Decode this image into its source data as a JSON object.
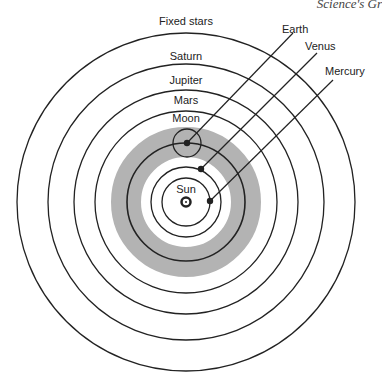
{
  "header": {
    "running_title": "Science's Gr"
  },
  "diagram": {
    "center_label": "Sun",
    "orbits": [
      {
        "name": "Fixed stars",
        "label": "Fixed stars"
      },
      {
        "name": "Saturn",
        "label": "Saturn"
      },
      {
        "name": "Jupiter",
        "label": "Jupiter"
      },
      {
        "name": "Mars",
        "label": "Mars"
      },
      {
        "name": "Moon",
        "label": "Moon"
      }
    ],
    "callouts": [
      {
        "name": "Earth",
        "label": "Earth"
      },
      {
        "name": "Venus",
        "label": "Venus"
      },
      {
        "name": "Mercury",
        "label": "Mercury"
      }
    ],
    "colors": {
      "line": "#222222",
      "band": "#b3b3b3",
      "background": "#ffffff"
    }
  }
}
